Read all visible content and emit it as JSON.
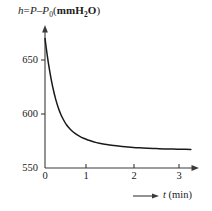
{
  "chart_data": {
    "type": "line",
    "title_parts": {
      "var": "h",
      "equals": "=",
      "expr_p": "P",
      "minus": "–",
      "expr_p0": "P",
      "p0_sub": "0",
      "unit_open": "(",
      "unit_mm": "mm",
      "unit_h": "H",
      "unit_h_sub": "2",
      "unit_o": "O",
      "unit_close": ")"
    },
    "xlabel": "t (min)",
    "xlabel_parts": {
      "symbol": "t",
      "unit": "(min)"
    },
    "ylabel": "h",
    "xlim": [
      0,
      3.45
    ],
    "ylim": [
      550,
      672
    ],
    "xticks": [
      0,
      1,
      2,
      3
    ],
    "xtick_labels": [
      "0",
      "1",
      "2",
      "3"
    ],
    "yticks": [
      550,
      600,
      650
    ],
    "ytick_labels": [
      "550",
      "600",
      "650"
    ],
    "grid": false,
    "legend": null,
    "axis_arrows": {
      "x": true,
      "y": true
    },
    "line_color": "#1a1a1a",
    "axis_color": "#3a3a3a",
    "x": [
      0.0,
      0.05,
      0.1,
      0.15,
      0.2,
      0.25,
      0.3,
      0.35,
      0.4,
      0.5,
      0.6,
      0.7,
      0.8,
      0.9,
      1.0,
      1.2,
      1.4,
      1.6,
      1.8,
      2.0,
      2.2,
      2.4,
      2.6,
      2.8,
      3.0,
      3.2,
      3.4
    ],
    "y": [
      670.0,
      655.0,
      642.0,
      631.0,
      621.5,
      613.5,
      607.0,
      601.5,
      597.0,
      590.0,
      585.5,
      582.0,
      579.5,
      577.5,
      576.0,
      573.5,
      572.0,
      570.8,
      570.0,
      569.3,
      568.7,
      568.3,
      568.0,
      567.7,
      567.5,
      567.3,
      567.2
    ]
  }
}
